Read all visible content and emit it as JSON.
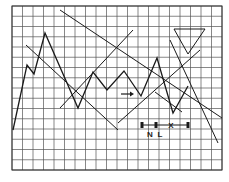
{
  "figure": {
    "colors": {
      "grid": "#555555",
      "line": "#1a1a1a",
      "background": "#ffffff"
    }
  },
  "grid": {
    "x0": 12,
    "y0": 6,
    "x1": 222,
    "y1": 170,
    "cols": 20,
    "rows": 16
  },
  "price_path": [
    [
      13,
      130
    ],
    [
      27,
      65
    ],
    [
      34,
      74
    ],
    [
      45,
      33
    ],
    [
      78,
      108
    ],
    [
      93,
      72
    ],
    [
      107,
      90
    ],
    [
      124,
      71
    ],
    [
      141,
      96
    ],
    [
      157,
      58
    ],
    [
      173,
      113
    ],
    [
      188,
      86
    ]
  ],
  "trend_lines": [
    [
      [
        60,
        10
      ],
      [
        222,
        118
      ]
    ],
    [
      [
        26,
        45
      ],
      [
        118,
        130
      ]
    ],
    [
      [
        60,
        108
      ],
      [
        133,
        30
      ]
    ],
    [
      [
        118,
        123
      ],
      [
        200,
        50
      ]
    ],
    [
      [
        170,
        40
      ],
      [
        218,
        143
      ]
    ],
    [
      [
        155,
        92
      ],
      [
        182,
        112
      ]
    ]
  ],
  "triangle": [
    [
      174,
      29
    ],
    [
      205,
      29
    ],
    [
      188,
      54
    ]
  ],
  "arrow": {
    "from": [
      121,
      94
    ],
    "to": [
      134,
      94
    ],
    "label_icon": "right-arrow-icon"
  },
  "measurement": {
    "y": 125,
    "ticks_x": [
      142,
      156,
      188
    ],
    "labels": [
      {
        "text": "N",
        "x": 150,
        "y": 137
      },
      {
        "text": "L",
        "x": 160,
        "y": 137
      },
      {
        "text": "X",
        "x": 171,
        "y": 128
      }
    ]
  }
}
